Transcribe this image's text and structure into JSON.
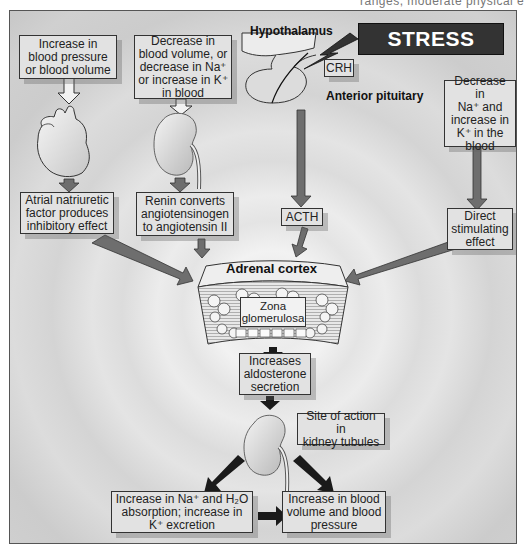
{
  "top_text": "ranges, moderate physical e",
  "diagram": {
    "stress": "STRESS",
    "hypothalamus_label": "Hypothalamus",
    "anterior_pituitary_label": "Anterior pituitary",
    "crh_label": "CRH",
    "acth_label": "ACTH",
    "adrenal_cortex_label": "Adrenal cortex",
    "zona_glomerulosa_label": [
      "Zona",
      "glomerulosa"
    ],
    "boxes": {
      "bp_increase": [
        "Increase in",
        "blood pressure",
        "or blood volume"
      ],
      "blood_volume_decrease": [
        "Decrease in",
        "blood volume, or",
        "decrease in Na⁺",
        "or increase in K⁺",
        "in blood"
      ],
      "na_decrease": [
        "Decrease in",
        "Na⁺ and",
        "increase in",
        "K⁺ in the",
        "blood"
      ],
      "anf": [
        "Atrial natriuretic",
        "factor produces",
        "inhibitory effect"
      ],
      "renin": [
        "Renin converts",
        "angiotensinogen",
        "to angiotensin II"
      ],
      "direct": [
        "Direct",
        "stimulating",
        "effect"
      ],
      "aldosterone": [
        "Increases",
        "aldosterone",
        "secretion"
      ],
      "site_of_action": [
        "Site of action in",
        "kidney tubules"
      ],
      "na_h2o_absorption": [
        "Increase in Na⁺ and H₂O",
        "absorption; increase in",
        "K⁺ excretion"
      ],
      "blood_volume_pressure": [
        "Increase in blood",
        "volume and blood",
        "pressure"
      ]
    }
  },
  "colors": {
    "box_fill": "#e2e2e2",
    "arrow_fill": "#6e6e6e",
    "arrow_dark": "#1a1a1a",
    "stress_fill": "#333333"
  }
}
